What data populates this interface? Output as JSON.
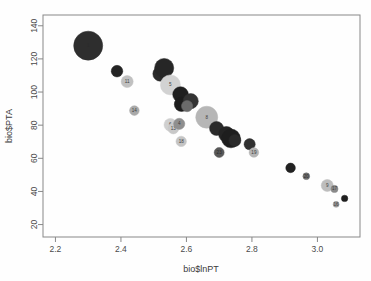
{
  "figure": {
    "background": "#ffffff",
    "frame_color": "#888888",
    "plot_area": {
      "left": 43,
      "top": 15,
      "right": 360,
      "bottom": 237
    }
  },
  "axes": {
    "x": {
      "label": "bio$lnPT",
      "ticks": [
        2.2,
        2.4,
        2.6,
        2.8,
        3.0
      ],
      "tick_labels": [
        "2.2",
        "2.4",
        "2.6",
        "2.8",
        "3.0"
      ],
      "range": [
        2.162,
        3.13
      ]
    },
    "y": {
      "label": "bio$PTA",
      "ticks": [
        20,
        40,
        60,
        80,
        100,
        120,
        140
      ],
      "tick_labels": [
        "20",
        "40",
        "60",
        "80",
        "100",
        "120",
        "140"
      ],
      "range": [
        12.5,
        146.5
      ]
    }
  },
  "chart_data": {
    "type": "scatter",
    "title": "",
    "xlabel": "bio$lnPT",
    "ylabel": "bio$PTA",
    "xlim": [
      2.162,
      3.13
    ],
    "ylim": [
      12.5,
      146.5
    ],
    "grid": false,
    "legend": "none",
    "encoding": {
      "size": "bubble radius varies per observation",
      "color": "grayscale fill, dark to light",
      "label": "observation index drawn at point centre"
    },
    "points": [
      {
        "label": "1",
        "x": 2.3,
        "y": 128.0,
        "r": 14.5,
        "fill": "#2e2e2e"
      },
      {
        "label": "",
        "x": 2.388,
        "y": 112.6,
        "r": 5.8,
        "fill": "#242424"
      },
      {
        "label": "11",
        "x": 2.419,
        "y": 106.3,
        "r": 6.0,
        "fill": "#c0c0c0"
      },
      {
        "label": "14",
        "x": 2.441,
        "y": 88.8,
        "r": 4.8,
        "fill": "#a9a9a9"
      },
      {
        "label": "",
        "x": 2.52,
        "y": 111.0,
        "r": 7.4,
        "fill": "#2a2a2a"
      },
      {
        "label": "",
        "x": 2.532,
        "y": 114.5,
        "r": 9.6,
        "fill": "#262626"
      },
      {
        "label": "5",
        "x": 2.551,
        "y": 104.3,
        "r": 10.0,
        "fill": "#d2d2d2"
      },
      {
        "label": "",
        "x": 2.582,
        "y": 98.5,
        "r": 7.8,
        "fill": "#1f1f1f"
      },
      {
        "label": "",
        "x": 2.585,
        "y": 92.6,
        "r": 7.2,
        "fill": "#1c1c1c"
      },
      {
        "label": "",
        "x": 2.613,
        "y": 94.5,
        "r": 7.6,
        "fill": "#333333"
      },
      {
        "label": "",
        "x": 2.602,
        "y": 91.5,
        "r": 5.6,
        "fill": "#6a6a6a"
      },
      {
        "label": "6",
        "x": 2.551,
        "y": 80.2,
        "r": 6.4,
        "fill": "#cfcfcf"
      },
      {
        "label": "13",
        "x": 2.56,
        "y": 78.0,
        "r": 5.4,
        "fill": "#c8c8c8"
      },
      {
        "label": "4",
        "x": 2.578,
        "y": 80.8,
        "r": 5.6,
        "fill": "#8f8f8f"
      },
      {
        "label": "18",
        "x": 2.584,
        "y": 70.2,
        "r": 5.2,
        "fill": "#c4c4c4"
      },
      {
        "label": "8",
        "x": 2.662,
        "y": 84.8,
        "r": 11.0,
        "fill": "#b6b6b6"
      },
      {
        "label": "",
        "x": 2.692,
        "y": 78.0,
        "r": 7.0,
        "fill": "#2b2b2b"
      },
      {
        "label": "",
        "x": 2.722,
        "y": 74.5,
        "r": 7.8,
        "fill": "#242424"
      },
      {
        "label": "",
        "x": 2.736,
        "y": 72.0,
        "r": 9.4,
        "fill": "#1e1e1e"
      },
      {
        "label": "",
        "x": 2.748,
        "y": 70.8,
        "r": 6.0,
        "fill": "#2a2a2a"
      },
      {
        "label": "",
        "x": 2.793,
        "y": 68.5,
        "r": 5.6,
        "fill": "#303030"
      },
      {
        "label": "23",
        "x": 2.7,
        "y": 63.5,
        "r": 5.0,
        "fill": "#585858"
      },
      {
        "label": "19",
        "x": 2.806,
        "y": 63.5,
        "r": 4.8,
        "fill": "#b4b4b4"
      },
      {
        "label": "",
        "x": 2.918,
        "y": 54.2,
        "r": 4.8,
        "fill": "#212121"
      },
      {
        "label": "20",
        "x": 2.966,
        "y": 49.2,
        "r": 3.4,
        "fill": "#6f6f6f"
      },
      {
        "label": "9",
        "x": 3.03,
        "y": 43.6,
        "r": 6.0,
        "fill": "#bdbdbd"
      },
      {
        "label": "17",
        "x": 3.052,
        "y": 41.5,
        "r": 3.6,
        "fill": "#8a8a8a"
      },
      {
        "label": "16",
        "x": 3.057,
        "y": 32.2,
        "r": 3.0,
        "fill": "#9a9a9a"
      },
      {
        "label": "",
        "x": 3.083,
        "y": 35.8,
        "r": 3.2,
        "fill": "#1f1f1f"
      }
    ]
  }
}
